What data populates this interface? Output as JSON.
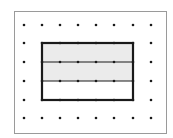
{
  "diagram": {
    "colors": {
      "background": "#ffffff",
      "frame": "#9a9a9a",
      "dot": "#1a1a1a",
      "rect_border": "#1a1a1a",
      "divider": "#1a1a1a",
      "shade": "#ebebeb"
    },
    "frame": {
      "x": 14,
      "y": 11,
      "width": 152,
      "height": 122
    },
    "grid": {
      "columns_x": [
        24,
        42,
        60,
        78,
        96,
        114,
        133,
        151
      ],
      "rows_y": [
        25,
        43,
        62,
        81,
        100,
        118
      ],
      "dot_radius": 1.3
    },
    "rectangle": {
      "col_start": 1,
      "col_end": 6,
      "row_start": 1,
      "row_end": 4,
      "strips": [
        {
          "row_from": 1,
          "row_to": 2,
          "shaded": true
        },
        {
          "row_from": 2,
          "row_to": 3,
          "shaded": true
        },
        {
          "row_from": 3,
          "row_to": 4,
          "shaded": false
        }
      ]
    }
  }
}
